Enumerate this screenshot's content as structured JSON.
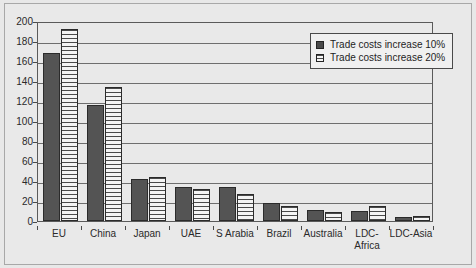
{
  "chart_data": {
    "type": "bar",
    "title": "",
    "xlabel": "",
    "ylabel": "",
    "ylim": [
      0,
      200
    ],
    "ytick_step": 20,
    "grid": true,
    "legend_position": "top-right",
    "categories": [
      "EU",
      "China",
      "Japan",
      "UAE",
      "S Arabia",
      "Brazil",
      "Australia",
      "LDC-Africa",
      "LDC-Asia"
    ],
    "category_lines": [
      [
        "EU"
      ],
      [
        "China"
      ],
      [
        "Japan"
      ],
      [
        "UAE"
      ],
      [
        "S Arabia"
      ],
      [
        "Brazil"
      ],
      [
        "Australia"
      ],
      [
        "LDC-",
        "Africa"
      ],
      [
        "LDC-Asia"
      ]
    ],
    "ytick_labels": [
      "0",
      "20",
      "40",
      "60",
      "80",
      "100",
      "120",
      "140",
      "160",
      "180",
      "200"
    ],
    "ytick_values": [
      0,
      20,
      40,
      60,
      80,
      100,
      120,
      140,
      160,
      180,
      200
    ],
    "series": [
      {
        "name": "Trade costs increase 10%",
        "color": "#545454",
        "fill": "solid",
        "values": [
          168,
          116,
          42,
          34,
          34,
          18,
          11,
          10,
          4
        ]
      },
      {
        "name": "Trade costs increase 20%",
        "color": "#f2f2f2",
        "fill": "horizontal-hatch",
        "values": [
          192,
          134,
          44,
          32,
          27,
          15,
          9,
          15,
          5
        ]
      }
    ]
  },
  "legend": {
    "entries": [
      {
        "label": "Trade costs increase 10%"
      },
      {
        "label": "Trade costs increase 20%"
      }
    ]
  },
  "colors": {
    "series1": "#545454",
    "series2": "#f2f2f2",
    "axis": "#5a5a5a",
    "grid": "#6e6e6e",
    "background": "#e9e9e9",
    "text": "#2a2a2a"
  }
}
